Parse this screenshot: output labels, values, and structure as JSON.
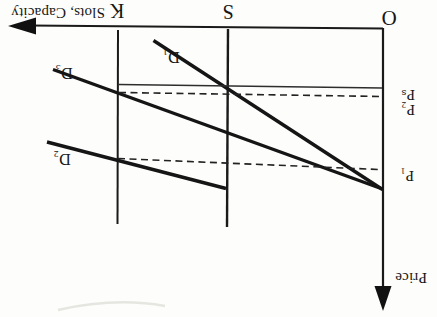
{
  "colors": {
    "ink": "#1a1a1a",
    "background": "#fdfdfb"
  },
  "figure": {
    "x_axis_label": "Slots, Capacity",
    "y_axis_label": "Price",
    "origin_label": "O",
    "ticks": {
      "capacity": "K",
      "slots": "S"
    },
    "demand_curves": [
      {
        "label": "D₁"
      },
      {
        "label": "D₃"
      },
      {
        "label": "D₂"
      }
    ],
    "price_levels": [
      {
        "label": "Pₛ"
      },
      {
        "label": "P₂"
      },
      {
        "label": "P₁"
      }
    ]
  }
}
